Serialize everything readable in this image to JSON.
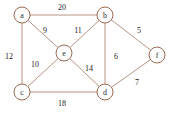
{
  "figure": {
    "kind": "weighted-undirected-graph",
    "width": 172,
    "height": 115,
    "background_color": "#ffffff",
    "edge_color": "#b08878",
    "node_stroke_color": "#9a6a52",
    "node_fill_color": "#ffffff",
    "label_color": "#1a1a1a"
  },
  "chart_data": {
    "type": "diagram",
    "title": "",
    "xlabel": "",
    "ylabel": "",
    "grid": false,
    "legend": false,
    "nodes": [
      {
        "id": "a",
        "label": "a",
        "x": 22,
        "y": 15,
        "r": 8
      },
      {
        "id": "b",
        "label": "b",
        "x": 105,
        "y": 15,
        "r": 8
      },
      {
        "id": "e",
        "label": "e",
        "x": 64,
        "y": 53,
        "r": 8
      },
      {
        "id": "f",
        "label": "f",
        "x": 157,
        "y": 55,
        "r": 8
      },
      {
        "id": "c",
        "label": "c",
        "x": 22,
        "y": 92,
        "r": 8
      },
      {
        "id": "d",
        "label": "d",
        "x": 105,
        "y": 92,
        "r": 8
      }
    ],
    "edges": [
      {
        "source": "a",
        "target": "b",
        "weight": 20,
        "label": "20",
        "lx": 62,
        "ly": 7
      },
      {
        "source": "a",
        "target": "c",
        "weight": 12,
        "label": "12",
        "lx": 9,
        "ly": 56
      },
      {
        "source": "a",
        "target": "e",
        "weight": 9,
        "label": "9",
        "lx": 45,
        "ly": 30
      },
      {
        "source": "b",
        "target": "e",
        "weight": 11,
        "label": "11",
        "lx": 78,
        "ly": 30
      },
      {
        "source": "b",
        "target": "d",
        "weight": 6,
        "label": "6",
        "lx": 116,
        "ly": 56
      },
      {
        "source": "b",
        "target": "f",
        "weight": 5,
        "label": "5",
        "lx": 139,
        "ly": 30
      },
      {
        "source": "c",
        "target": "e",
        "weight": 10,
        "label": "10",
        "lx": 35,
        "ly": 64
      },
      {
        "source": "c",
        "target": "d",
        "weight": 18,
        "label": "18",
        "lx": 62,
        "ly": 103
      },
      {
        "source": "d",
        "target": "e",
        "weight": 14,
        "label": "14",
        "lx": 89,
        "ly": 68
      },
      {
        "source": "d",
        "target": "f",
        "weight": 7,
        "label": "7",
        "lx": 137,
        "ly": 82
      }
    ]
  }
}
